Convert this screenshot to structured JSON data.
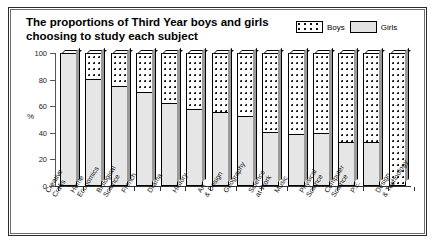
{
  "figure": {
    "title": "The proportions of Third Year boys and girls choosing to study each subject",
    "title_line1": "The proportions of Third Year boys and girls",
    "title_line2": "choosing to study each subject"
  },
  "legend": {
    "position": "top-right",
    "entries": [
      {
        "label": "Boys",
        "swatch": "dotted",
        "color": "#ffffff"
      },
      {
        "label": "Girls",
        "swatch": "solid",
        "color": "#e6e6e6"
      }
    ]
  },
  "chart_data": {
    "type": "bar",
    "stacked": true,
    "stack_total": 100,
    "title": "The proportions of Third Year boys and girls choosing to study each subject",
    "xlabel": "",
    "ylabel": "%",
    "ylim": [
      0,
      100
    ],
    "yticks": [
      0,
      20,
      40,
      60,
      80,
      100
    ],
    "ytick_labels": [
      "0",
      "20",
      "40",
      "60",
      "80",
      "100"
    ],
    "grid": false,
    "legend_position": "top-right",
    "categories": [
      "Creative Crafts",
      "Home Economics",
      "Biological Science",
      "French",
      "Drama",
      "History",
      "Art & Design",
      "Geography",
      "Science at Work",
      "Music",
      "Physical Science",
      "Computer Science",
      "P.E.",
      "Design & Technology"
    ],
    "series": [
      {
        "name": "Girls",
        "values": [
          100,
          80,
          75,
          70,
          62,
          57,
          55,
          52,
          40,
          38,
          39,
          32,
          32,
          0
        ]
      },
      {
        "name": "Boys",
        "values": [
          0,
          20,
          25,
          30,
          38,
          43,
          45,
          48,
          60,
          62,
          61,
          68,
          68,
          100
        ]
      }
    ]
  },
  "axis": {
    "y_title": "%"
  }
}
